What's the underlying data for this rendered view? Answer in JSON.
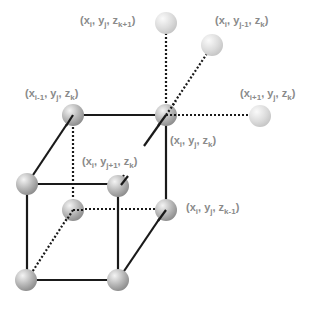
{
  "diagram": {
    "type": "3d-grid-stencil",
    "colors": {
      "line": "#1a1a1a",
      "label": "#8a8a8a",
      "sphere_dark": "#a9a9a9",
      "sphere_light": "#d6d6d6"
    },
    "labels": [
      {
        "id": "z-plus",
        "text": "(x_i, y_j, z_k+1)",
        "parts": [
          "(x",
          "i",
          ", y",
          "j",
          ", z",
          "k+1",
          ")"
        ]
      },
      {
        "id": "y-minus",
        "text": "(x_i, y_j-1, z_k)",
        "parts": [
          "(x",
          "i",
          ", y",
          "j-1",
          ", z",
          "k",
          ")"
        ]
      },
      {
        "id": "x-minus",
        "text": "(x_i-1, y_j, z_k)",
        "parts": [
          "(x",
          "i-1",
          ", y",
          "j",
          ", z",
          "k",
          ")"
        ]
      },
      {
        "id": "x-plus",
        "text": "(x_i+1, y_j, z_k)",
        "parts": [
          "(x",
          "i+1",
          ", y",
          "j",
          ", z",
          "k",
          ")"
        ]
      },
      {
        "id": "center",
        "text": "(x_i, y_j, z_k)",
        "parts": [
          "(x",
          "i",
          ", y",
          "j",
          ", z",
          "k",
          ")"
        ]
      },
      {
        "id": "y-plus",
        "text": "(x_i, y_j+1, z_k)",
        "parts": [
          "(x",
          "i",
          ", y",
          "j+1",
          ", z",
          "k",
          ")"
        ]
      },
      {
        "id": "z-minus",
        "text": "(x_i, y_j, z_k-1)",
        "parts": [
          "(x",
          "i",
          ", y",
          "j",
          ", z",
          "k-1",
          ")"
        ]
      }
    ]
  }
}
